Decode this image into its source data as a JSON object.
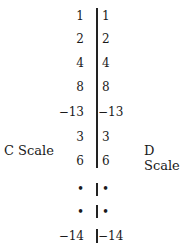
{
  "labels": {
    "left": "C Scale",
    "right": "D Scale"
  },
  "rows": [
    {
      "c": "1",
      "d": "1"
    },
    {
      "c": "2",
      "d": "2"
    },
    {
      "c": "4",
      "d": "4"
    },
    {
      "c": "8",
      "d": "8"
    },
    {
      "c": "−13",
      "d": "−13"
    },
    {
      "c": "3",
      "d": "3"
    },
    {
      "c": "6",
      "d": "6"
    },
    {
      "c": "•",
      "d": "•"
    },
    {
      "c": "•",
      "d": "•"
    },
    {
      "c": "−14",
      "d": "−14"
    }
  ]
}
